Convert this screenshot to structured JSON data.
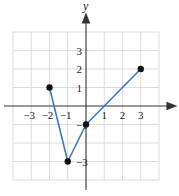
{
  "chart_data": {
    "type": "line",
    "title": "",
    "xlabel": "",
    "ylabel": "y",
    "xlim": [
      -4,
      4
    ],
    "ylim": [
      -4,
      4
    ],
    "grid": true,
    "x_ticks": [
      "-3",
      "-2",
      "-1",
      "1",
      "2",
      "3"
    ],
    "y_ticks": [
      "3",
      "2",
      "1",
      "-1",
      "-3"
    ],
    "series": [
      {
        "name": "piecewise",
        "color": "#3a78c2",
        "points": [
          {
            "x": -2,
            "y": 1
          },
          {
            "x": -1,
            "y": -3
          },
          {
            "x": 0,
            "y": -1
          },
          {
            "x": 3,
            "y": 2
          }
        ]
      }
    ]
  },
  "labels": {
    "y_axis": "y",
    "x_ticks": [
      {
        "text": "−3",
        "v": -3
      },
      {
        "text": "−2",
        "v": -2
      },
      {
        "text": "−1",
        "v": -1
      },
      {
        "text": "1",
        "v": 1
      },
      {
        "text": "2",
        "v": 2
      },
      {
        "text": "3",
        "v": 3
      }
    ],
    "y_ticks": [
      {
        "text": "3",
        "v": 3
      },
      {
        "text": "2",
        "v": 2
      },
      {
        "text": "1",
        "v": 1
      },
      {
        "text": "−1",
        "v": -1
      },
      {
        "text": "−3",
        "v": -3
      }
    ]
  }
}
